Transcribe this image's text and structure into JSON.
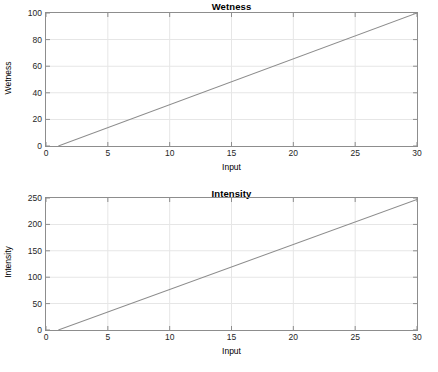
{
  "figure": {
    "background": "#ffffff",
    "axis_color": "#8d8d8d",
    "grid_color": "#e6e6e6",
    "line_color": "#8c8c8c",
    "text_color": "#262626"
  },
  "chart_data": [
    {
      "type": "line",
      "title": "Wetness",
      "xlabel": "Input",
      "ylabel": "Wetness",
      "xlim": [
        0,
        30
      ],
      "ylim": [
        0,
        100
      ],
      "xticks": [
        "0",
        "5",
        "10",
        "15",
        "20",
        "25",
        "30"
      ],
      "xtick_values": [
        0,
        5,
        10,
        15,
        20,
        25,
        30
      ],
      "yticks": [
        "0",
        "20",
        "40",
        "60",
        "80",
        "100"
      ],
      "ytick_values": [
        0,
        20,
        40,
        60,
        80,
        100
      ],
      "grid": true,
      "legend": null,
      "series": [
        {
          "name": "Wetness",
          "x": [
            1,
            30
          ],
          "y": [
            0,
            100
          ],
          "color": "#8c8c8c"
        }
      ]
    },
    {
      "type": "line",
      "title": "Intensity",
      "xlabel": "Input",
      "ylabel": "Intensity",
      "xlim": [
        0,
        30
      ],
      "ylim": [
        0,
        250
      ],
      "xticks": [
        "0",
        "5",
        "10",
        "15",
        "20",
        "25",
        "30"
      ],
      "xtick_values": [
        0,
        5,
        10,
        15,
        20,
        25,
        30
      ],
      "yticks": [
        "0",
        "50",
        "100",
        "150",
        "200",
        "250"
      ],
      "ytick_values": [
        0,
        50,
        100,
        150,
        200,
        250
      ],
      "grid": true,
      "legend": null,
      "series": [
        {
          "name": "Intensity",
          "x": [
            1,
            30
          ],
          "y": [
            0,
            247
          ],
          "color": "#8c8c8c"
        }
      ]
    }
  ]
}
